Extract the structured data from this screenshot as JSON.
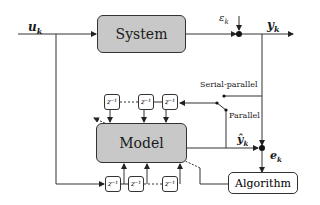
{
  "diagram": {
    "blocks": {
      "system": "System",
      "model": "Model",
      "algorithm": "Algorithm"
    },
    "signals": {
      "input": "u",
      "input_sub": "k",
      "noise": "ε",
      "noise_sub": "k",
      "output": "y",
      "output_sub": "k",
      "model_output": "ŷ",
      "model_output_sub": "k",
      "error": "e",
      "error_sub": "k"
    },
    "switch_labels": {
      "serial_parallel": "Serial-parallel",
      "parallel": "Parallel"
    },
    "delay_label": "z⁻¹",
    "top_delays": [
      "z⁻¹",
      "z⁻¹",
      "z⁻¹"
    ],
    "bottom_delays": [
      "z⁻¹",
      "z⁻¹",
      "z⁻¹"
    ],
    "colors": {
      "block_fill": "#c8c8c8",
      "line": "#333333"
    }
  }
}
